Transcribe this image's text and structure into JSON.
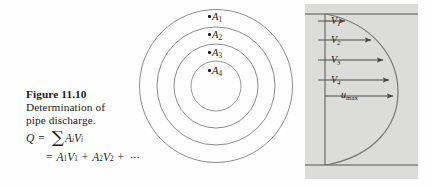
{
  "figure": {
    "number_label": "Figure 11.10",
    "caption_lines": [
      "Determination of",
      "pipe discharge."
    ],
    "equations": {
      "line1": {
        "lhs": "Q",
        "equals": "=",
        "sigma": "∑",
        "terms": "A",
        "term_sub_1": "i",
        "terms_2": "V",
        "term_sub_2": "i"
      },
      "line2": {
        "equals": "=",
        "t1": "A",
        "t1s": "1",
        "t2": "V",
        "t2s": "1",
        "plus1": "+",
        "t3": "A",
        "t3s": "2",
        "t4": "V",
        "t4s": "2",
        "plus2": "+",
        "ellipsis": "⋯"
      }
    }
  },
  "pipe_cross_section": {
    "name": "concentric-area-rings",
    "ring_count": 4,
    "labels": [
      {
        "text": "A",
        "sub": "1"
      },
      {
        "text": "A",
        "sub": "2"
      },
      {
        "text": "A",
        "sub": "3"
      },
      {
        "text": "A",
        "sub": "4"
      }
    ]
  },
  "velocity_profile": {
    "name": "pipe-velocity-profile",
    "labels": [
      {
        "text": "V",
        "sub": "1"
      },
      {
        "text": "V",
        "sub": "2"
      },
      {
        "text": "V",
        "sub": "3"
      },
      {
        "text": "V",
        "sub": "4"
      },
      {
        "text": "u",
        "sub": "max"
      }
    ]
  },
  "colors": {
    "panel_background": "#dcdcda",
    "line": "#6e6e6e",
    "text": "#1a1a1a",
    "page_background": "#fefefe"
  }
}
